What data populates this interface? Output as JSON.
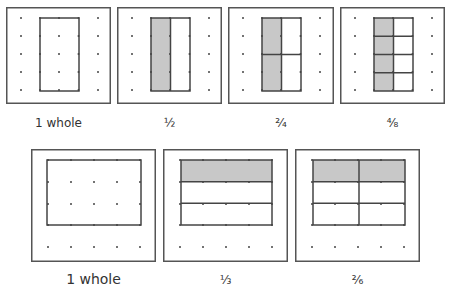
{
  "figure": {
    "colors": {
      "shade": "#c8c8c8",
      "line": "#444444",
      "dot": "#444444",
      "frame": "#555555"
    },
    "top_row": [
      {
        "id": "top-whole",
        "label": "1 whole",
        "box": [
          6,
          7,
          105,
          97
        ],
        "rect": [
          40,
          18,
          39,
          73
        ],
        "cols": 1,
        "rows": 1,
        "shaded": []
      },
      {
        "id": "top-thirds",
        "label": "1/2",
        "box": [
          117,
          7,
          105,
          97
        ],
        "rect": [
          151,
          18,
          39,
          73
        ],
        "cols": 2,
        "rows": 1,
        "shaded": [
          [
            0,
            0
          ]
        ]
      },
      {
        "id": "top-quarters",
        "label": "2/4",
        "box": [
          228,
          7,
          106,
          97
        ],
        "rect": [
          262,
          18,
          39,
          73
        ],
        "cols": 2,
        "rows": 2,
        "shaded": [
          [
            0,
            0
          ],
          [
            0,
            1
          ]
        ]
      },
      {
        "id": "top-eighths",
        "label": "4/8",
        "box": [
          340,
          7,
          105,
          97
        ],
        "rect": [
          374,
          18,
          39,
          73
        ],
        "cols": 2,
        "rows": 4,
        "shaded": [
          [
            0,
            0
          ],
          [
            0,
            1
          ],
          [
            0,
            2
          ],
          [
            0,
            3
          ]
        ]
      }
    ],
    "bottom_row": [
      {
        "id": "bottom-whole",
        "label": "1 whole",
        "box": [
          31,
          149,
          125,
          113
        ],
        "rect": [
          47,
          160,
          94,
          65
        ],
        "cols": 1,
        "rows": 1,
        "shaded": []
      },
      {
        "id": "bottom-thirds",
        "label": "1/3",
        "box": [
          163,
          149,
          125,
          113
        ],
        "rect": [
          181,
          160,
          91,
          65
        ],
        "cols": 1,
        "rows": 3,
        "shaded": [
          [
            0,
            0
          ]
        ]
      },
      {
        "id": "bottom-sixths",
        "label": "2/6",
        "box": [
          295,
          149,
          125,
          113
        ],
        "rect": [
          313,
          160,
          92,
          65
        ],
        "cols": 2,
        "rows": 3,
        "shaded": [
          [
            0,
            0
          ],
          [
            1,
            0
          ]
        ]
      }
    ],
    "labels": {
      "top": [
        "1 whole",
        "½",
        "²⁄₄",
        "⁴⁄₈"
      ],
      "bottom": [
        "1 whole",
        "⅓",
        "²⁄₆"
      ]
    }
  }
}
